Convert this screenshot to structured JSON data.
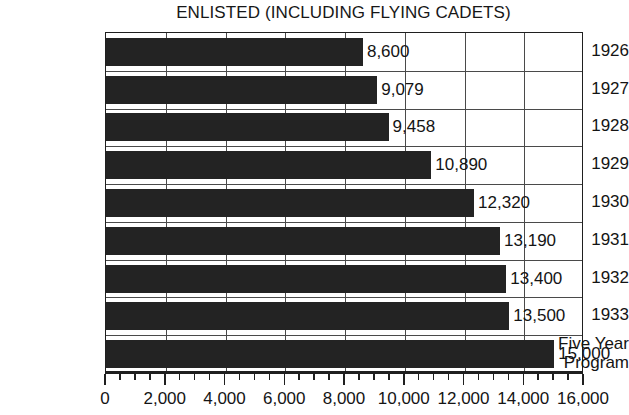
{
  "chart_data": {
    "type": "bar",
    "orientation": "horizontal",
    "title": "ENLISTED (INCLUDING FLYING CADETS)",
    "xlabel": "",
    "ylabel": "",
    "xlim": [
      0,
      16000
    ],
    "grid": true,
    "legend": false,
    "categories": [
      "1926",
      "1927",
      "1928",
      "1929",
      "1930",
      "1931",
      "1932",
      "1933",
      "Five Year Program"
    ],
    "values": [
      8600,
      9079,
      9458,
      10890,
      12320,
      13190,
      13400,
      13500,
      15000
    ],
    "data_labels": [
      "8,600",
      "9,079",
      "9,458",
      "10,890",
      "12,320",
      "13,190",
      "13,400",
      "13,500",
      "15,000"
    ],
    "category_lines": [
      [
        "1926"
      ],
      [
        "1927"
      ],
      [
        "1928"
      ],
      [
        "1929"
      ],
      [
        "1930"
      ],
      [
        "1931"
      ],
      [
        "1932"
      ],
      [
        "1933"
      ],
      [
        "Five Year",
        "Program"
      ]
    ],
    "x_ticks": [
      0,
      2000,
      4000,
      6000,
      8000,
      10000,
      12000,
      14000,
      16000
    ],
    "x_tick_labels": [
      "0",
      "2,000",
      "4,000",
      "6,000",
      "8,000",
      "10,000",
      "12,000",
      "14,000",
      "16,000"
    ],
    "x_minor_tick_interval": 500,
    "colors": {
      "bar": "#232323",
      "axis": "#1f1f1f",
      "grid": "#4a4a4a",
      "text": "#141414",
      "background": "#ffffff"
    }
  }
}
